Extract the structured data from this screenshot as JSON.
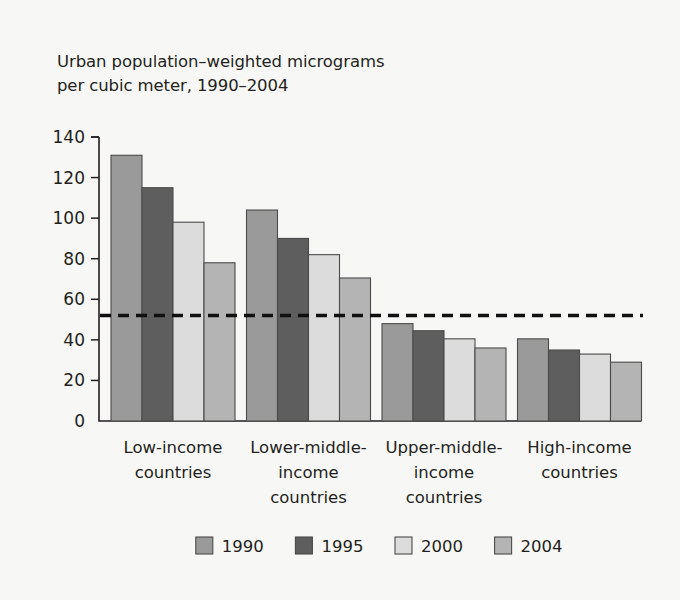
{
  "figure": {
    "background_color": "#f7f7f5",
    "title_text": "Urban population–weighted micrograms\nper cubic meter, 1990–2004"
  },
  "chart_data": {
    "type": "bar",
    "title": "Urban population–weighted micrograms per cubic meter, 1990–2004",
    "subtitle": "",
    "xlabel": "",
    "ylabel": "",
    "ylim": [
      0,
      140
    ],
    "ytick_step": 20,
    "yticks": [
      0,
      20,
      40,
      60,
      80,
      100,
      120,
      140
    ],
    "ytick_labels": [
      "0",
      "20",
      "40",
      "60",
      "80",
      "100",
      "120",
      "140"
    ],
    "grid": false,
    "legend_position": "bottom-center",
    "categories": [
      "Low-income countries",
      "Lower-middle-income countries",
      "Upper-middle-income countries",
      "High-income countries"
    ],
    "category_label_lines": [
      [
        "Low-income",
        "countries"
      ],
      [
        "Lower-middle-",
        "income",
        "countries"
      ],
      [
        "Upper-middle-",
        "income",
        "countries"
      ],
      [
        "High-income",
        "countries"
      ]
    ],
    "series": [
      {
        "name": "1990",
        "color": "#9a9a9a",
        "values": [
          131,
          104,
          48,
          40.5
        ]
      },
      {
        "name": "1995",
        "color": "#5e5e5e",
        "values": [
          115,
          90,
          44.5,
          35
        ]
      },
      {
        "name": "2000",
        "color": "#dcdcdc",
        "values": [
          98,
          82,
          40.5,
          33
        ]
      },
      {
        "name": "2004",
        "color": "#b4b4b4",
        "values": [
          78,
          70.5,
          36,
          29
        ]
      }
    ],
    "annotations": [
      {
        "name": "threshold-line",
        "type": "horizontal-dashed-line",
        "value": 52,
        "color": "#101010"
      }
    ]
  },
  "legend": {
    "entries": [
      {
        "label": "1990",
        "color": "#9a9a9a"
      },
      {
        "label": "1995",
        "color": "#5e5e5e"
      },
      {
        "label": "2000",
        "color": "#dcdcdc"
      },
      {
        "label": "2004",
        "color": "#b4b4b4"
      }
    ]
  }
}
